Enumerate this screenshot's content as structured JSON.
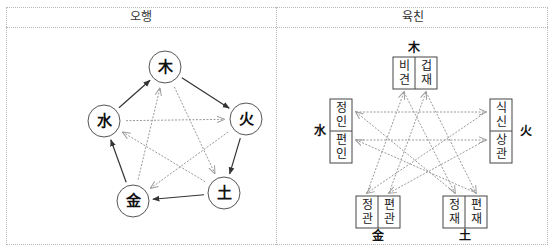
{
  "table": {
    "headers": [
      "오행",
      "육친"
    ]
  },
  "ohaeng": {
    "nodes": [
      {
        "id": "wood",
        "label": "木"
      },
      {
        "id": "fire",
        "label": "火"
      },
      {
        "id": "earth",
        "label": "土"
      },
      {
        "id": "metal",
        "label": "金"
      },
      {
        "id": "water",
        "label": "水"
      }
    ],
    "generating_cycle": [
      [
        "wood",
        "fire"
      ],
      [
        "fire",
        "earth"
      ],
      [
        "earth",
        "metal"
      ],
      [
        "metal",
        "water"
      ],
      [
        "water",
        "wood"
      ]
    ],
    "controlling_cycle": [
      [
        "wood",
        "earth"
      ],
      [
        "earth",
        "water"
      ],
      [
        "water",
        "fire"
      ],
      [
        "fire",
        "metal"
      ],
      [
        "metal",
        "wood"
      ]
    ]
  },
  "yukchin": {
    "groups": [
      {
        "id": "wood",
        "element": "木",
        "items": [
          "비견",
          "겁재"
        ]
      },
      {
        "id": "fire",
        "element": "火",
        "items": [
          "식신",
          "상관"
        ]
      },
      {
        "id": "earth",
        "element": "土",
        "items": [
          "정재",
          "편재"
        ]
      },
      {
        "id": "metal",
        "element": "金",
        "items": [
          "정관",
          "편관"
        ]
      },
      {
        "id": "water",
        "element": "水",
        "items": [
          "정인",
          "편인"
        ]
      }
    ]
  },
  "colors": {
    "solid_arrow": "#333333",
    "dotted_arrow": "#999999",
    "border": "#b8b8b8"
  }
}
